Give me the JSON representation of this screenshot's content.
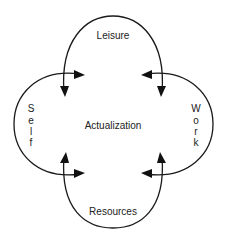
{
  "diagram": {
    "center_label": "Actualization",
    "nodes": {
      "top": "Leisure",
      "left": "Self",
      "right": "Work",
      "bottom": "Resources"
    },
    "left_letters": [
      "S",
      "e",
      "l",
      "f"
    ],
    "right_letters": [
      "W",
      "o",
      "r",
      "k"
    ],
    "colors": {
      "stroke": "#1a1a1a",
      "text": "#222222",
      "background": "#ffffff"
    }
  }
}
